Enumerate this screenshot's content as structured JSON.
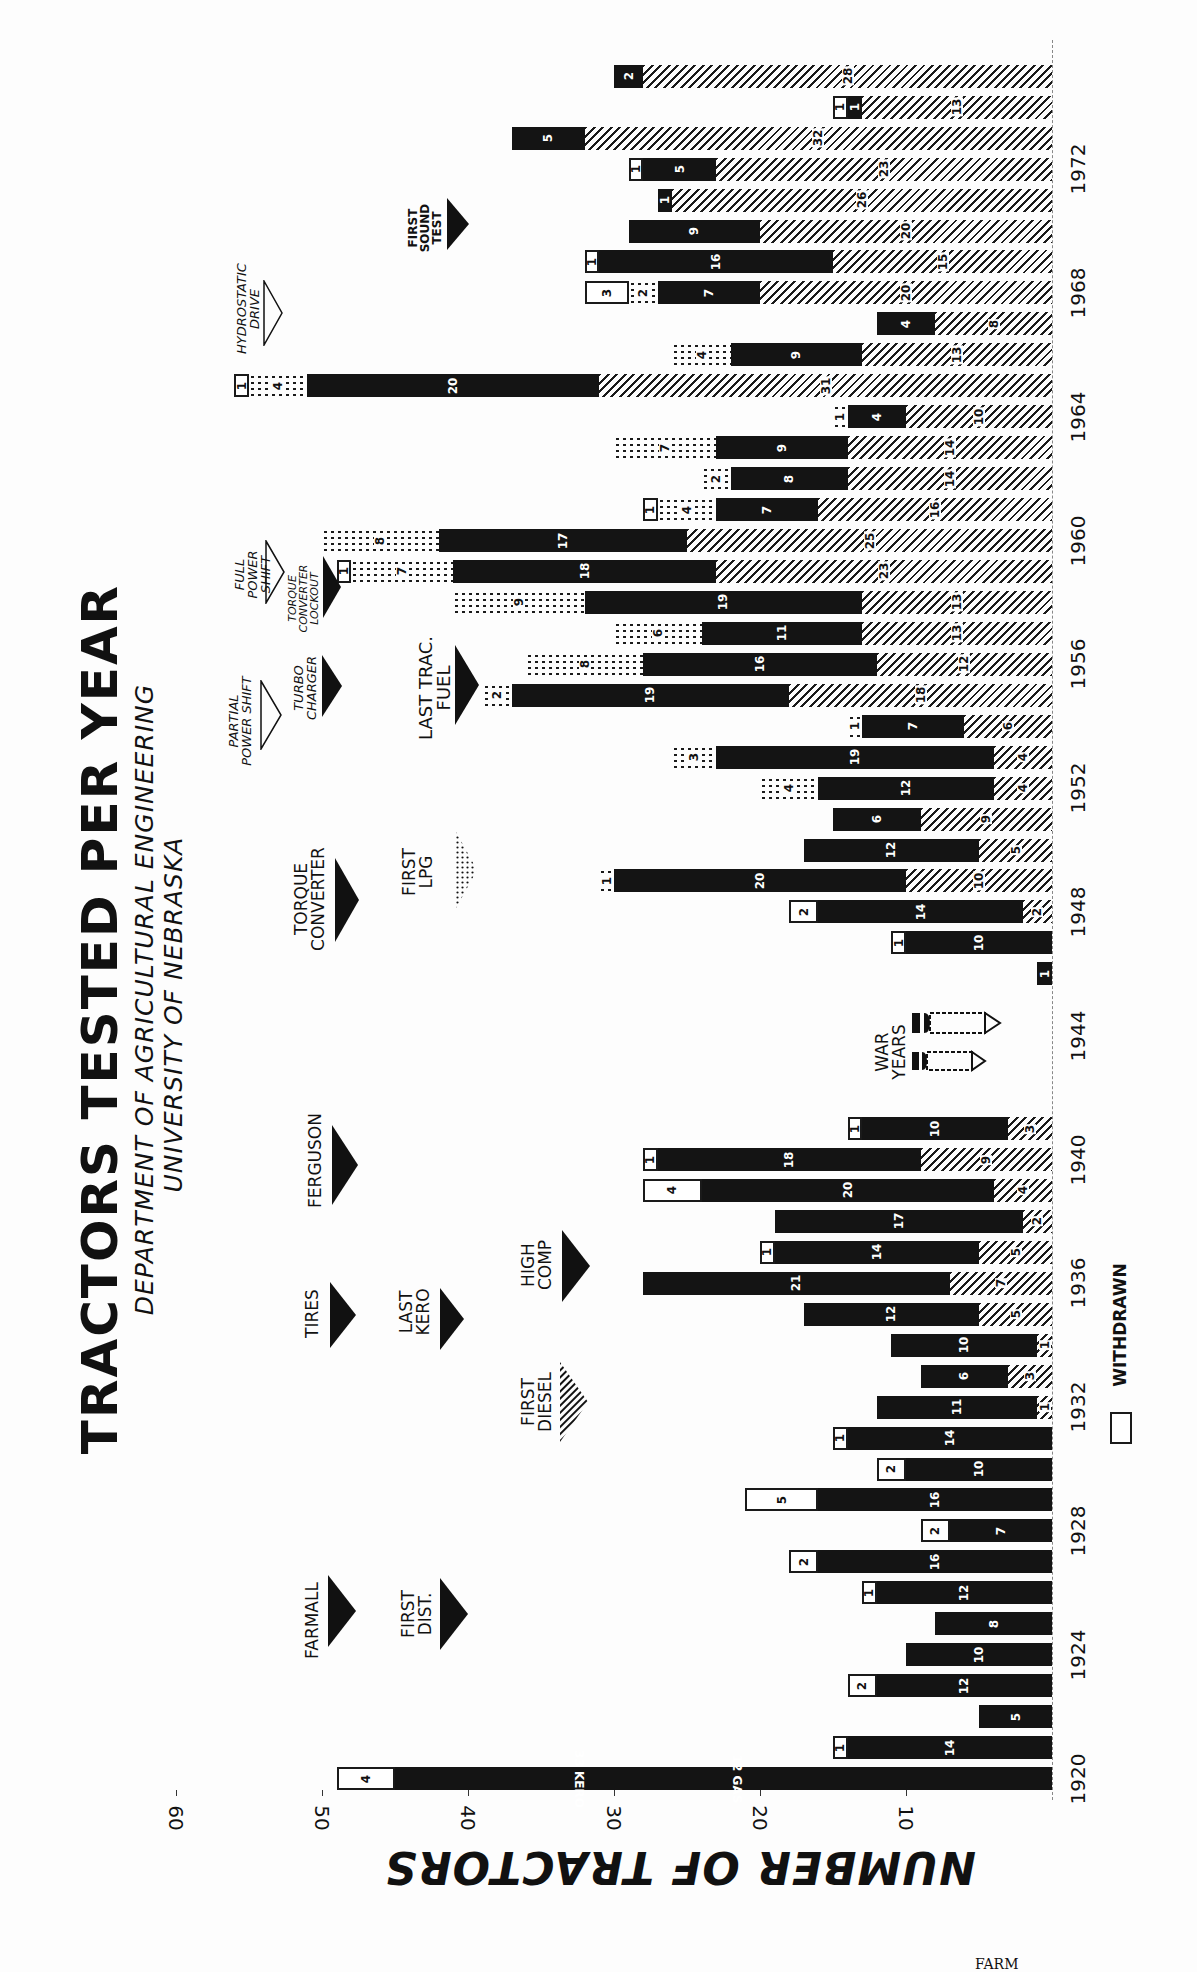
{
  "title": "TRACTORS TESTED PER YEAR",
  "subtitle_1": "DEPARTMENT OF AGRICULTURAL ENGINEERING",
  "subtitle_2": "UNIVERSITY OF NEBRASKA",
  "axis_title": "NUMBER OF TRACTORS",
  "legend": {
    "withdrawn_label": "WITHDRAWN"
  },
  "footer_fragment": "FARM",
  "ticks": [
    "10",
    "20",
    "30",
    "40",
    "50",
    "60"
  ],
  "year_labels": [
    "1920",
    "1924",
    "1928",
    "1932",
    "1936",
    "1940",
    "1944",
    "1948",
    "1952",
    "1956",
    "1960",
    "1964",
    "1968",
    "1972"
  ],
  "annotations": {
    "farmall": "FARMALL",
    "first_dist": "FIRST DIST.",
    "tires": "TIRES",
    "last_kero": "LAST KERO",
    "first_diesel": "FIRST DIESEL",
    "high_comp": "HIGH COMP",
    "ferguson": "FERGUSON",
    "war_years": "WAR YEARS",
    "torque_converter": "TORQUE CONVERTER",
    "first_lpg": "FIRST LPG",
    "partial_power_shift": "PARTIAL POWER SHIFT",
    "turbo_charger": "TURBO CHARGER",
    "last_trac_fuel": "LAST TRAC. FUEL",
    "full_power_shift": "FULL POWER SHIFT",
    "torque_converter_lockout": "TORQUE CONVERTER LOCKOUT",
    "hydrostatic_drive": "HYDROSTATIC DRIVE",
    "first_sound_test": "FIRST SOUND TEST"
  },
  "chart_data": {
    "type": "bar",
    "orientation": "horizontal-stacked (page rotated 90°)",
    "title": "TRACTORS TESTED PER YEAR",
    "subtitle": "DEPARTMENT OF AGRICULTURAL ENGINEERING, UNIVERSITY OF NEBRASKA",
    "xlabel": "Year",
    "ylabel": "NUMBER OF TRACTORS",
    "ylim": [
      0,
      65
    ],
    "yticks": [
      10,
      20,
      30,
      40,
      50,
      60
    ],
    "legend": [
      "WITHDRAWN"
    ],
    "series_order_from_axis": [
      "diesel",
      "gas",
      "lpg",
      "withdrawn"
    ],
    "series_styles": {
      "gas": "solid black",
      "diesel": "diagonal hatch",
      "lpg": "dotted",
      "withdrawn": "white box"
    },
    "years": [
      {
        "year": 1920,
        "gas": 45,
        "gas_note": "33 KERO / 12 GAS",
        "diesel": 0,
        "lpg": 0,
        "withdrawn": 4
      },
      {
        "year": 1921,
        "gas": 14,
        "diesel": 0,
        "lpg": 0,
        "withdrawn": 1
      },
      {
        "year": 1922,
        "gas": 5,
        "diesel": 0,
        "lpg": 0,
        "withdrawn": 0
      },
      {
        "year": 1923,
        "gas": 12,
        "diesel": 0,
        "lpg": 0,
        "withdrawn": 2
      },
      {
        "year": 1924,
        "gas": 10,
        "diesel": 0,
        "lpg": 0,
        "withdrawn": 0
      },
      {
        "year": 1925,
        "gas": 8,
        "diesel": 0,
        "lpg": 0,
        "withdrawn": 0
      },
      {
        "year": 1926,
        "gas": 12,
        "diesel": 0,
        "lpg": 0,
        "withdrawn": 1
      },
      {
        "year": 1927,
        "gas": 16,
        "diesel": 0,
        "lpg": 0,
        "withdrawn": 2
      },
      {
        "year": 1928,
        "gas": 7,
        "diesel": 0,
        "lpg": 0,
        "withdrawn": 2
      },
      {
        "year": 1929,
        "gas": 16,
        "diesel": 0,
        "lpg": 0,
        "withdrawn": 5
      },
      {
        "year": 1930,
        "gas": 10,
        "diesel": 0,
        "lpg": 0,
        "withdrawn": 2
      },
      {
        "year": 1931,
        "gas": 14,
        "diesel": 0,
        "lpg": 0,
        "withdrawn": 1
      },
      {
        "year": 1932,
        "gas": 11,
        "diesel": 1,
        "lpg": 0,
        "withdrawn": 0
      },
      {
        "year": 1933,
        "gas": 6,
        "diesel": 3,
        "lpg": 0,
        "withdrawn": 0
      },
      {
        "year": 1934,
        "gas": 10,
        "diesel": 1,
        "lpg": 0,
        "withdrawn": 0
      },
      {
        "year": 1935,
        "gas": 12,
        "diesel": 5,
        "lpg": 0,
        "withdrawn": 0
      },
      {
        "year": 1936,
        "gas": 21,
        "diesel": 7,
        "lpg": 0,
        "withdrawn": 0
      },
      {
        "year": 1937,
        "gas": 14,
        "diesel": 5,
        "lpg": 0,
        "withdrawn": 1
      },
      {
        "year": 1938,
        "gas": 17,
        "diesel": 2,
        "lpg": 0,
        "withdrawn": 0
      },
      {
        "year": 1939,
        "gas": 20,
        "diesel": 4,
        "lpg": 0,
        "withdrawn": 4
      },
      {
        "year": 1940,
        "gas": 18,
        "diesel": 9,
        "lpg": 0,
        "withdrawn": 1
      },
      {
        "year": 1941,
        "gas": 10,
        "diesel": 3,
        "lpg": 0,
        "withdrawn": 1
      },
      {
        "year": 1942,
        "gas": 0,
        "diesel": 0,
        "lpg": 0,
        "withdrawn": 0
      },
      {
        "year": 1943,
        "gas": 0,
        "diesel": 0,
        "lpg": 0,
        "withdrawn": 0
      },
      {
        "year": 1944,
        "gas": 0,
        "diesel": 0,
        "lpg": 0,
        "withdrawn": 0
      },
      {
        "year": 1945,
        "gas": 0,
        "diesel": 0,
        "lpg": 0,
        "withdrawn": 0
      },
      {
        "year": 1946,
        "gas": 1,
        "diesel": 0,
        "lpg": 0,
        "withdrawn": 0
      },
      {
        "year": 1947,
        "gas": 10,
        "diesel": 0,
        "lpg": 0,
        "withdrawn": 1
      },
      {
        "year": 1948,
        "gas": 14,
        "diesel": 2,
        "lpg": 0,
        "withdrawn": 2
      },
      {
        "year": 1949,
        "gas": 20,
        "diesel": 10,
        "lpg": 1,
        "withdrawn": 0
      },
      {
        "year": 1950,
        "gas": 12,
        "diesel": 5,
        "lpg": 0,
        "withdrawn": 0
      },
      {
        "year": 1951,
        "gas": 6,
        "diesel": 9,
        "lpg": 0,
        "withdrawn": 0
      },
      {
        "year": 1952,
        "gas": 12,
        "diesel": 4,
        "lpg": 4,
        "withdrawn": 0
      },
      {
        "year": 1953,
        "gas": 19,
        "diesel": 4,
        "lpg": 3,
        "withdrawn": 0
      },
      {
        "year": 1954,
        "gas": 7,
        "diesel": 6,
        "lpg": 1,
        "withdrawn": 0
      },
      {
        "year": 1955,
        "gas": 19,
        "diesel": 18,
        "lpg": 2,
        "withdrawn": 0
      },
      {
        "year": 1956,
        "gas": 16,
        "diesel": 12,
        "lpg": 8,
        "withdrawn": 0
      },
      {
        "year": 1957,
        "gas": 11,
        "diesel": 13,
        "lpg": 6,
        "withdrawn": 0
      },
      {
        "year": 1958,
        "gas": 19,
        "diesel": 13,
        "lpg": 9,
        "withdrawn": 0
      },
      {
        "year": 1959,
        "gas": 18,
        "diesel": 23,
        "lpg": 7,
        "withdrawn": 1
      },
      {
        "year": 1960,
        "gas": 17,
        "diesel": 25,
        "lpg": 8,
        "withdrawn": 0
      },
      {
        "year": 1961,
        "gas": 7,
        "diesel": 16,
        "lpg": 4,
        "withdrawn": 1
      },
      {
        "year": 1962,
        "gas": 8,
        "diesel": 14,
        "lpg": 2,
        "withdrawn": 0
      },
      {
        "year": 1963,
        "gas": 9,
        "diesel": 14,
        "lpg": 7,
        "withdrawn": 0
      },
      {
        "year": 1964,
        "gas": 4,
        "diesel": 10,
        "lpg": 1,
        "withdrawn": 0
      },
      {
        "year": 1965,
        "gas": 20,
        "diesel": 31,
        "lpg": 4,
        "withdrawn": 1
      },
      {
        "year": 1966,
        "gas": 9,
        "diesel": 13,
        "lpg": 4,
        "withdrawn": 0
      },
      {
        "year": 1967,
        "gas": 4,
        "diesel": 8,
        "lpg": 0,
        "withdrawn": 0
      },
      {
        "year": 1968,
        "gas": 7,
        "diesel": 20,
        "lpg": 2,
        "withdrawn": 3
      },
      {
        "year": 1969,
        "gas": 16,
        "diesel": 15,
        "lpg": 0,
        "withdrawn": 1
      },
      {
        "year": 1970,
        "gas": 9,
        "diesel": 20,
        "lpg": 0,
        "withdrawn": 0
      },
      {
        "year": 1971,
        "gas": 1,
        "diesel": 26,
        "lpg": 0,
        "withdrawn": 0
      },
      {
        "year": 1972,
        "gas": 5,
        "diesel": 23,
        "lpg": 0,
        "withdrawn": 1
      },
      {
        "year": 1973,
        "gas": 5,
        "diesel": 32,
        "lpg": 0,
        "withdrawn": 0
      },
      {
        "year": 1974,
        "gas": 1,
        "diesel": 13,
        "lpg": 0,
        "withdrawn": 1
      },
      {
        "year": 1975,
        "gas": 2,
        "diesel": 28,
        "lpg": 0,
        "withdrawn": 0
      }
    ],
    "special_labels": {
      "1920": [
        "33 KERO",
        "12 GAS"
      ]
    }
  }
}
